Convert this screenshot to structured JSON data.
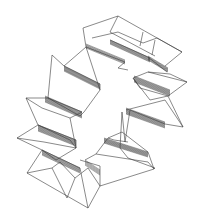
{
  "figure": {
    "width": 198,
    "height": 222,
    "stroke_color": "#3a3a3a",
    "background": "#ffffff"
  },
  "polylines": [
    {
      "name": "top-box-outer",
      "pts": [
        [
          83,
          28
        ],
        [
          118,
          16
        ],
        [
          182,
          52
        ],
        [
          165,
          66
        ]
      ]
    },
    {
      "name": "top-box-back-top",
      "pts": [
        [
          118,
          16
        ],
        [
          110,
          32
        ],
        [
          155,
          56
        ]
      ]
    },
    {
      "name": "top-box-left-wall",
      "pts": [
        [
          83,
          28
        ],
        [
          86,
          47
        ],
        [
          125,
          62
        ],
        [
          118,
          68
        ],
        [
          128,
          70
        ]
      ]
    },
    {
      "name": "top-box-diag1",
      "pts": [
        [
          92,
          38
        ],
        [
          118,
          32
        ],
        [
          143,
          43
        ]
      ]
    },
    {
      "name": "top-box-diag2",
      "pts": [
        [
          143,
          43
        ],
        [
          157,
          38
        ],
        [
          182,
          52
        ]
      ]
    },
    {
      "name": "top-box-vert1",
      "pts": [
        [
          143,
          32
        ],
        [
          140,
          46
        ]
      ]
    },
    {
      "name": "top-box-vert2",
      "pts": [
        [
          155,
          40
        ],
        [
          152,
          55
        ]
      ]
    },
    {
      "name": "top-box-inner-fold",
      "pts": [
        [
          110,
          40
        ],
        [
          148,
          57
        ],
        [
          167,
          72
        ]
      ]
    },
    {
      "name": "upper-left-panel",
      "pts": [
        [
          52,
          55
        ],
        [
          48,
          98
        ],
        [
          80,
          116
        ],
        [
          84,
          112
        ],
        [
          100,
          90
        ],
        [
          86,
          47
        ]
      ]
    },
    {
      "name": "upper-left-top",
      "pts": [
        [
          52,
          55
        ],
        [
          64,
          66
        ],
        [
          100,
          84
        ],
        [
          100,
          90
        ]
      ]
    },
    {
      "name": "upper-left-diag",
      "pts": [
        [
          64,
          66
        ],
        [
          86,
          47
        ]
      ]
    },
    {
      "name": "left-mid-panel",
      "pts": [
        [
          26,
          98
        ],
        [
          48,
          98
        ],
        [
          82,
          112
        ],
        [
          70,
          118
        ],
        [
          42,
          108
        ],
        [
          26,
          98
        ]
      ]
    },
    {
      "name": "left-mid-wall",
      "pts": [
        [
          26,
          98
        ],
        [
          38,
          125
        ],
        [
          70,
          140
        ],
        [
          76,
          148
        ],
        [
          70,
          118
        ]
      ]
    },
    {
      "name": "left-lower-panel",
      "pts": [
        [
          17,
          138
        ],
        [
          38,
          125
        ],
        [
          76,
          140
        ],
        [
          76,
          148
        ],
        [
          44,
          142
        ],
        [
          17,
          138
        ]
      ]
    },
    {
      "name": "left-lower-wall",
      "pts": [
        [
          17,
          138
        ],
        [
          42,
          150
        ],
        [
          56,
          160
        ],
        [
          76,
          148
        ]
      ]
    },
    {
      "name": "bottom-box-outer",
      "pts": [
        [
          27,
          173
        ],
        [
          42,
          150
        ],
        [
          80,
          168
        ],
        [
          88,
          208
        ],
        [
          27,
          173
        ]
      ]
    },
    {
      "name": "bottom-box-diag1",
      "pts": [
        [
          27,
          173
        ],
        [
          52,
          168
        ],
        [
          67,
          198
        ]
      ]
    },
    {
      "name": "bottom-box-diag2",
      "pts": [
        [
          52,
          168
        ],
        [
          60,
          162
        ],
        [
          75,
          178
        ],
        [
          67,
          198
        ]
      ]
    },
    {
      "name": "bottom-box-diag3",
      "pts": [
        [
          75,
          178
        ],
        [
          88,
          168
        ],
        [
          100,
          186
        ],
        [
          88,
          208
        ]
      ]
    },
    {
      "name": "bottom-box-right",
      "pts": [
        [
          80,
          160
        ],
        [
          100,
          166
        ],
        [
          100,
          186
        ]
      ]
    },
    {
      "name": "bottom-right-panel",
      "pts": [
        [
          85,
          160
        ],
        [
          96,
          154
        ],
        [
          148,
          162
        ],
        [
          154,
          169
        ],
        [
          100,
          186
        ]
      ]
    },
    {
      "name": "lower-right-wall",
      "pts": [
        [
          96,
          154
        ],
        [
          108,
          138
        ],
        [
          122,
          132
        ],
        [
          148,
          152
        ],
        [
          154,
          169
        ]
      ]
    },
    {
      "name": "lower-right-rise",
      "pts": [
        [
          108,
          138
        ],
        [
          114,
          140
        ],
        [
          128,
          142
        ]
      ]
    },
    {
      "name": "right-mid-panel",
      "pts": [
        [
          122,
          112
        ],
        [
          125,
          142
        ],
        [
          130,
          110
        ],
        [
          165,
          124
        ],
        [
          183,
          127
        ],
        [
          165,
          100
        ],
        [
          126,
          110
        ]
      ]
    },
    {
      "name": "right-mid-lower",
      "pts": [
        [
          122,
          112
        ],
        [
          120,
          148
        ],
        [
          128,
          158
        ],
        [
          155,
          168
        ],
        [
          154,
          169
        ]
      ]
    },
    {
      "name": "right-upper-panel",
      "pts": [
        [
          133,
          78
        ],
        [
          148,
          72
        ],
        [
          187,
          82
        ],
        [
          168,
          96
        ],
        [
          140,
          88
        ],
        [
          133,
          78
        ]
      ]
    },
    {
      "name": "right-upper-wall",
      "pts": [
        [
          133,
          78
        ],
        [
          150,
          100
        ],
        [
          168,
          96
        ],
        [
          183,
          127
        ]
      ]
    },
    {
      "name": "right-upper-top",
      "pts": [
        [
          148,
          72
        ],
        [
          170,
          74
        ],
        [
          187,
          82
        ]
      ]
    }
  ],
  "hatched_bands": [
    {
      "name": "band-top-inner",
      "from": [
        [
          110,
          40
        ],
        [
          150,
          58
        ]
      ],
      "to": [
        [
          110,
          44
        ],
        [
          150,
          62
        ]
      ],
      "count": 6
    },
    {
      "name": "band-top-right",
      "from": [
        [
          148,
          56
        ],
        [
          168,
          68
        ]
      ],
      "to": [
        [
          148,
          60
        ],
        [
          168,
          72
        ]
      ],
      "count": 6
    },
    {
      "name": "band-upper-left",
      "from": [
        [
          64,
          66
        ],
        [
          100,
          84
        ]
      ],
      "to": [
        [
          64,
          71
        ],
        [
          100,
          89
        ]
      ],
      "count": 8
    },
    {
      "name": "band-left-mid",
      "from": [
        [
          45,
          96
        ],
        [
          82,
          112
        ]
      ],
      "to": [
        [
          45,
          102
        ],
        [
          82,
          118
        ]
      ],
      "count": 9
    },
    {
      "name": "band-left-lower",
      "from": [
        [
          38,
          125
        ],
        [
          76,
          140
        ]
      ],
      "to": [
        [
          38,
          131
        ],
        [
          76,
          146
        ]
      ],
      "count": 9
    },
    {
      "name": "band-bottom-left",
      "from": [
        [
          42,
          150
        ],
        [
          80,
          168
        ]
      ],
      "to": [
        [
          42,
          155
        ],
        [
          80,
          173
        ]
      ],
      "count": 7
    },
    {
      "name": "band-bottom-mid",
      "from": [
        [
          85,
          160
        ],
        [
          100,
          170
        ]
      ],
      "to": [
        [
          85,
          165
        ],
        [
          100,
          175
        ]
      ],
      "count": 5
    },
    {
      "name": "band-lower-right",
      "from": [
        [
          104,
          138
        ],
        [
          148,
          152
        ]
      ],
      "to": [
        [
          104,
          143
        ],
        [
          148,
          157
        ]
      ],
      "count": 8
    },
    {
      "name": "band-right-mid",
      "from": [
        [
          126,
          108
        ],
        [
          165,
          122
        ]
      ],
      "to": [
        [
          126,
          114
        ],
        [
          165,
          128
        ]
      ],
      "count": 9
    },
    {
      "name": "band-right-upper",
      "from": [
        [
          134,
          76
        ],
        [
          170,
          90
        ]
      ],
      "to": [
        [
          134,
          82
        ],
        [
          170,
          96
        ]
      ],
      "count": 9
    },
    {
      "name": "band-top-left-box",
      "from": [
        [
          86,
          44
        ],
        [
          125,
          60
        ]
      ],
      "to": [
        [
          86,
          48
        ],
        [
          125,
          64
        ]
      ],
      "count": 5
    }
  ]
}
